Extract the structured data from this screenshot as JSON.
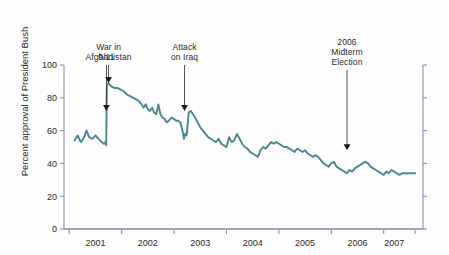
{
  "chart_data": {
    "type": "line",
    "title": "",
    "xlabel": "",
    "ylabel": "Percent approval of President Bush",
    "ylim": [
      0,
      100
    ],
    "yticks": [
      0,
      20,
      40,
      60,
      80,
      100
    ],
    "ytick_labels": [
      "0",
      "20",
      "40",
      "60",
      "80",
      "100"
    ],
    "xlim": [
      2000.9,
      2007.75
    ],
    "xticks": [
      2001.0,
      2002.0,
      2003.0,
      2004.0,
      2005.0,
      2006.0,
      2007.0,
      2007.6
    ],
    "xtick_labels": [
      "2001",
      "2002",
      "2003",
      "2004",
      "2005",
      "2006",
      "2007"
    ],
    "xtick_label_positions": [
      2001.5,
      2002.5,
      2003.5,
      2004.5,
      2005.5,
      2006.5,
      2007.2
    ],
    "grid": false,
    "legend": false,
    "line_color": "#4d8694",
    "axis_color": "#8d8fae",
    "series": [
      {
        "name": "Percent approval of President Bush",
        "x": [
          2001.1,
          2001.16,
          2001.22,
          2001.27,
          2001.33,
          2001.38,
          2001.44,
          2001.5,
          2001.56,
          2001.62,
          2001.66,
          2001.69,
          2001.705,
          2001.712,
          2001.72,
          2001.75,
          2001.8,
          2001.86,
          2001.92,
          2001.98,
          2002.04,
          2002.1,
          2002.16,
          2002.22,
          2002.28,
          2002.33,
          2002.38,
          2002.42,
          2002.46,
          2002.5,
          2002.54,
          2002.58,
          2002.62,
          2002.66,
          2002.7,
          2002.74,
          2002.78,
          2002.82,
          2002.86,
          2002.9,
          2002.95,
          2003.0,
          2003.04,
          2003.08,
          2003.12,
          2003.16,
          2003.19,
          2003.21,
          2003.24,
          2003.28,
          2003.32,
          2003.36,
          2003.4,
          2003.45,
          2003.5,
          2003.55,
          2003.6,
          2003.65,
          2003.7,
          2003.75,
          2003.8,
          2003.85,
          2003.9,
          2003.95,
          2004.0,
          2004.05,
          2004.1,
          2004.15,
          2004.2,
          2004.25,
          2004.3,
          2004.35,
          2004.4,
          2004.45,
          2004.5,
          2004.55,
          2004.6,
          2004.65,
          2004.7,
          2004.75,
          2004.8,
          2004.85,
          2004.9,
          2004.95,
          2005.0,
          2005.05,
          2005.1,
          2005.15,
          2005.2,
          2005.25,
          2005.3,
          2005.35,
          2005.4,
          2005.45,
          2005.5,
          2005.55,
          2005.6,
          2005.65,
          2005.7,
          2005.75,
          2005.8,
          2005.85,
          2005.9,
          2005.95,
          2006.0,
          2006.05,
          2006.1,
          2006.15,
          2006.2,
          2006.25,
          2006.3,
          2006.35,
          2006.4,
          2006.45,
          2006.5,
          2006.55,
          2006.6,
          2006.65,
          2006.7,
          2006.75,
          2006.8,
          2006.85,
          2006.9,
          2006.95,
          2007.0,
          2007.05,
          2007.1,
          2007.15,
          2007.2,
          2007.25,
          2007.3,
          2007.35,
          2007.4,
          2007.45,
          2007.5,
          2007.55,
          2007.6
        ],
        "y": [
          54,
          57,
          53,
          55,
          60,
          56,
          55,
          57,
          55,
          53,
          52,
          53,
          51,
          72,
          88,
          89,
          87,
          86,
          86,
          85,
          84,
          82,
          81,
          80,
          79,
          78,
          76,
          74,
          76,
          73,
          72,
          74,
          71,
          70,
          76,
          70,
          68,
          67,
          65,
          66,
          68,
          67,
          66,
          66,
          65,
          60,
          55,
          58,
          57,
          71,
          72,
          70,
          68,
          65,
          62,
          60,
          58,
          56,
          55,
          54,
          53,
          55,
          52,
          51,
          50,
          56,
          53,
          54,
          58,
          55,
          52,
          50,
          49,
          47,
          46,
          45,
          44,
          48,
          50,
          49,
          51,
          53,
          52,
          53,
          52,
          51,
          50,
          50,
          49,
          48,
          47,
          49,
          48,
          47,
          48,
          46,
          45,
          44,
          45,
          44,
          42,
          40,
          39,
          38,
          40,
          41,
          38,
          37,
          36,
          35,
          34,
          36,
          35,
          37,
          38,
          39,
          40,
          41,
          40,
          38,
          37,
          36,
          35,
          34,
          33,
          35,
          34,
          36,
          35,
          34,
          33,
          34,
          34,
          34,
          34,
          34,
          34
        ]
      }
    ],
    "annotations": [
      {
        "name": "nine-eleven",
        "label": "9/11",
        "lines": [
          "9/11"
        ],
        "x": 2001.71,
        "arrow_tip_y": 72,
        "text_top_y": 100
      },
      {
        "name": "war-in-afghanistan",
        "label": "War in Afghanistan",
        "lines": [
          "War in",
          "Afghanistan"
        ],
        "x": 2001.75,
        "arrow_tip_y": 89,
        "text_top_y": 100
      },
      {
        "name": "attack-on-iraq",
        "label": "Attack on Iraq",
        "lines": [
          "Attack",
          "on Iraq"
        ],
        "x": 2003.2,
        "arrow_tip_y": 72,
        "text_top_y": 100
      },
      {
        "name": "midterm-election-2006",
        "label": "2006 Midterm Election",
        "lines": [
          "2006",
          "Midterm",
          "Election"
        ],
        "x": 2006.3,
        "arrow_tip_y": 48,
        "text_top_y": 97
      }
    ]
  }
}
